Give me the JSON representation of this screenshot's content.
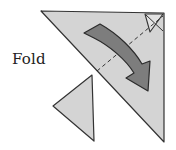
{
  "diagram": {
    "label": "Fold",
    "colors": {
      "paper_fill": "#d4d4d4",
      "paper_stroke": "#333333",
      "arrow_fill": "#7d7d7d",
      "arrow_stroke": "#2b2b2b",
      "fold_line": "#333333",
      "background": "#ffffff"
    },
    "shapes": {
      "main_triangle": "Large right triangle with right angle at top-right",
      "corner_flap": "Small folded corner triangle at top-right",
      "fold_line": "Dashed diagonal valley-fold line",
      "arrow": "Curved arrow indicating fold direction downward-right",
      "small_triangle": "Separate small triangle (result/other piece) at lower-left"
    }
  }
}
